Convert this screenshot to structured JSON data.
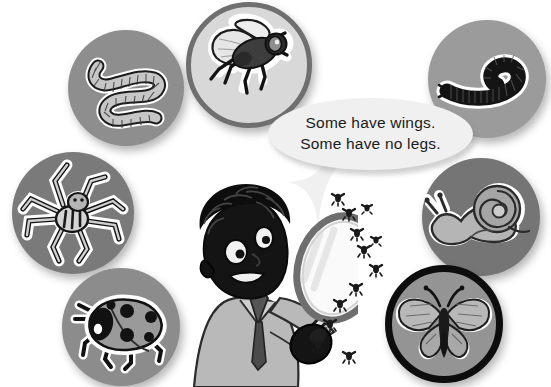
{
  "page": {
    "background_color": "#ffffff",
    "width": 551,
    "height": 387
  },
  "speech_bubble": {
    "name": "speech-bubble",
    "lines": [
      "Some have wings.",
      "Some have no legs."
    ],
    "fill_color": "#f0f0f0",
    "text_color": "#1b1b1b"
  },
  "character": {
    "name": "boy-with-magnifying-glass",
    "description": "Boy with curly hair holding a magnifying glass",
    "skin_color": "#141414",
    "coat_color": "#b9b9b9",
    "hair_color": "#101010",
    "magnifier_rim_color": "#6e6e6e",
    "magnifier_lens_color": "#f2f2f2",
    "handle_color": "#1a1a1a"
  },
  "fly_swarm": {
    "name": "fly-swarm",
    "count": 12,
    "color": "#1a1a1a",
    "positions": [
      {
        "x": 338,
        "y": 198
      },
      {
        "x": 349,
        "y": 213
      },
      {
        "x": 357,
        "y": 233
      },
      {
        "x": 364,
        "y": 250
      },
      {
        "x": 367,
        "y": 208
      },
      {
        "x": 376,
        "y": 269
      },
      {
        "x": 356,
        "y": 288
      },
      {
        "x": 340,
        "y": 304
      },
      {
        "x": 330,
        "y": 324
      },
      {
        "x": 318,
        "y": 345
      },
      {
        "x": 349,
        "y": 356
      },
      {
        "x": 376,
        "y": 240
      }
    ]
  },
  "creatures": [
    {
      "id": "worm",
      "name": "circle-worm",
      "label": "Worm",
      "disc_color": "#8e8e8e",
      "ring_color": "#8e8e8e",
      "ring_width": 0,
      "x": 68,
      "y": 30,
      "size": 116,
      "has_legs": false,
      "has_wings": false
    },
    {
      "id": "fly",
      "name": "circle-fly",
      "label": "Fly",
      "disc_color": "#d8d8d8",
      "ring_color": "#6f6f6f",
      "ring_width": 5,
      "x": 186,
      "y": 2,
      "size": 126,
      "has_legs": true,
      "has_wings": true
    },
    {
      "id": "millipede",
      "name": "circle-millipede",
      "label": "Millipede",
      "disc_color": "#9b9b9b",
      "ring_color": "#9b9b9b",
      "ring_width": 0,
      "x": 428,
      "y": 20,
      "size": 118,
      "has_legs": true,
      "has_wings": false
    },
    {
      "id": "spider",
      "name": "circle-spider",
      "label": "Spider",
      "disc_color": "#7a7a7a",
      "ring_color": "#7a7a7a",
      "ring_width": 0,
      "x": 12,
      "y": 152,
      "size": 122,
      "has_legs": true,
      "has_wings": false
    },
    {
      "id": "snail",
      "name": "circle-snail",
      "label": "Snail",
      "disc_color": "#757575",
      "ring_color": "#757575",
      "ring_width": 0,
      "x": 422,
      "y": 158,
      "size": 118,
      "has_legs": false,
      "has_wings": false
    },
    {
      "id": "ladybug",
      "name": "circle-ladybug",
      "label": "Ladybug",
      "disc_color": "#8c8c8c",
      "ring_color": "#8c8c8c",
      "ring_width": 0,
      "x": 62,
      "y": 268,
      "size": 118,
      "has_legs": true,
      "has_wings": true
    },
    {
      "id": "butterfly",
      "name": "circle-butterfly",
      "label": "Butterfly",
      "disc_color": "#949494",
      "ring_color": "#0d0d0d",
      "ring_width": 7,
      "x": 385,
      "y": 265,
      "size": 118,
      "has_legs": true,
      "has_wings": true
    }
  ]
}
